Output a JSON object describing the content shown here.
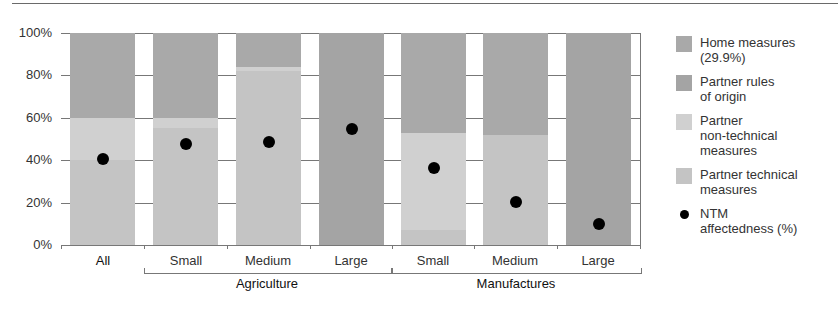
{
  "chart_data": {
    "type": "bar",
    "stacked": true,
    "title": "",
    "xlabel": "",
    "ylabel": "",
    "ylim": [
      0,
      100
    ],
    "yticks": [
      "0%",
      "20%",
      "40%",
      "60%",
      "80%",
      "100%"
    ],
    "grid": true,
    "legend_position": "right",
    "categories": [
      "All",
      "Small",
      "Medium",
      "Large",
      "Small",
      "Medium",
      "Large"
    ],
    "category_groups": [
      {
        "label": "",
        "members": [
          "All"
        ]
      },
      {
        "label": "Agriculture",
        "members": [
          "Small",
          "Medium",
          "Large"
        ]
      },
      {
        "label": "Manufactures",
        "members": [
          "Small",
          "Medium",
          "Large"
        ]
      }
    ],
    "series": [
      {
        "name": "Partner technical measures",
        "color": "#c4c4c4",
        "values": [
          40,
          55,
          82,
          0,
          7,
          52,
          0
        ]
      },
      {
        "name": "Partner non-technical measures",
        "color": "#d0d0d0",
        "values": [
          20,
          5,
          2,
          0,
          46,
          0,
          0
        ]
      },
      {
        "name": "Partner rules of origin",
        "color": "#a4a4a4",
        "values": [
          0,
          0,
          0,
          100,
          0,
          0,
          100
        ]
      },
      {
        "name": "Home measures (29.9%)",
        "color": "#a9a9a9",
        "values": [
          40,
          40,
          16,
          0,
          47,
          48,
          0
        ]
      }
    ],
    "overlay": {
      "name": "NTM affectedness (%)",
      "type": "scatter",
      "marker": "dot",
      "color": "#000000",
      "values": [
        40.5,
        47.5,
        48.8,
        54.5,
        36.5,
        20.5,
        10
      ]
    }
  },
  "axis": {
    "y_labels": [
      "100%",
      "80%",
      "60%",
      "40%",
      "20%",
      "0%"
    ]
  },
  "x_labels": [
    "All",
    "Small",
    "Medium",
    "Large",
    "Small",
    "Medium",
    "Large"
  ],
  "groups": {
    "agriculture": "Agriculture",
    "manufactures": "Manufactures"
  },
  "legend": [
    {
      "label_line1": "Home measures",
      "label_line2": "(29.9%)",
      "label_line3": "",
      "color": "#a9a9a9",
      "kind": "swatch"
    },
    {
      "label_line1": "Partner rules",
      "label_line2": "of origin",
      "label_line3": "",
      "color": "#a4a4a4",
      "kind": "swatch"
    },
    {
      "label_line1": "Partner",
      "label_line2": "non-technical",
      "label_line3": "measures",
      "color": "#d0d0d0",
      "kind": "swatch"
    },
    {
      "label_line1": "Partner technical",
      "label_line2": "measures",
      "label_line3": "",
      "color": "#c4c4c4",
      "kind": "swatch"
    },
    {
      "label_line1": "NTM",
      "label_line2": "affectedness (%)",
      "label_line3": "",
      "color": "#000000",
      "kind": "dot"
    }
  ]
}
